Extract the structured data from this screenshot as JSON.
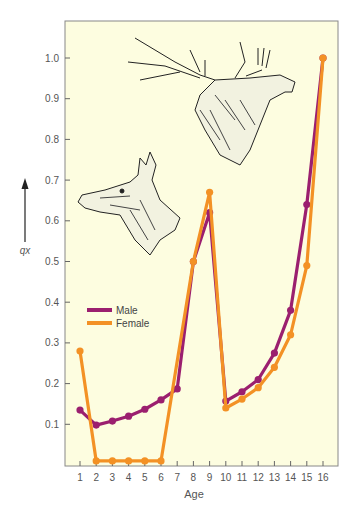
{
  "chart_data": {
    "type": "line",
    "title": "",
    "xlabel": "Age",
    "ylabel": "qx",
    "x": [
      1,
      2,
      3,
      4,
      5,
      6,
      7,
      8,
      9,
      10,
      11,
      12,
      13,
      14,
      15,
      16
    ],
    "x_ticks": [
      "1",
      "2",
      "3",
      "4",
      "5",
      "6",
      "7",
      "8",
      "9",
      "10",
      "11",
      "12",
      "13",
      "14",
      "15",
      "16"
    ],
    "y_ticks": [
      "0.1",
      "0.2",
      "0.3",
      "0.4",
      "0.5",
      "0.6",
      "0.7",
      "0.8",
      "0.9",
      "1.0"
    ],
    "ylim": [
      0,
      1.05
    ],
    "grid": false,
    "legend_position": "inside-left",
    "background_color": "#fdfde0",
    "series": [
      {
        "name": "Male",
        "color": "#9b1f6f",
        "values": [
          0.135,
          0.098,
          0.108,
          0.12,
          0.137,
          0.16,
          0.187,
          0.5,
          0.62,
          0.157,
          0.18,
          0.21,
          0.275,
          0.38,
          0.64,
          1.0
        ]
      },
      {
        "name": "Female",
        "color": "#f39125",
        "values": [
          0.28,
          0.01,
          0.01,
          0.01,
          0.01,
          0.01,
          null,
          0.5,
          0.67,
          0.14,
          0.162,
          0.19,
          0.24,
          0.32,
          0.49,
          1.0
        ]
      }
    ],
    "annotations": [
      "illustration: stag head (upper right)",
      "illustration: hind head (left)"
    ]
  },
  "legend": {
    "male_label": "Male",
    "female_label": "Female"
  },
  "axes": {
    "x_title": "Age",
    "y_title": "qx"
  }
}
